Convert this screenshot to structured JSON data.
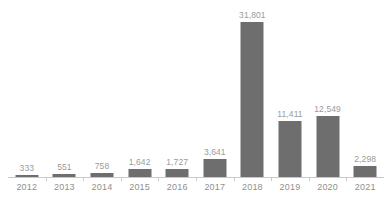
{
  "chart_data": {
    "type": "bar",
    "title": "",
    "subtitle": "",
    "xlabel": "",
    "ylabel": "",
    "categories": [
      "2012",
      "2013",
      "2014",
      "2015",
      "2016",
      "2017",
      "2018",
      "2019",
      "2020",
      "2021"
    ],
    "values": [
      333,
      551,
      758,
      1642,
      1727,
      3641,
      31801,
      11411,
      12549,
      2298
    ],
    "value_labels": [
      "333",
      "551",
      "758",
      "1,642",
      "1,727",
      "3,641",
      "31,801",
      "11,411",
      "12,549",
      "2,298"
    ],
    "series": [
      {
        "name": "",
        "values": [
          333,
          551,
          758,
          1642,
          1727,
          3641,
          31801,
          11411,
          12549,
          2298
        ]
      }
    ],
    "ylim": [
      0,
      31801
    ],
    "grid": false,
    "legend": false,
    "legend_position": "none",
    "axis": {
      "x_axis_visible": true,
      "y_axis_visible": false,
      "y_ticks_visible": false
    },
    "data_labels_visible": true,
    "colors": {
      "bar_fill": "#6e6e6e",
      "value_label": "#9a9a9a",
      "tick_label": "#8f8f8f",
      "axis_line": "#c9c9c9",
      "background": "#ffffff"
    }
  }
}
